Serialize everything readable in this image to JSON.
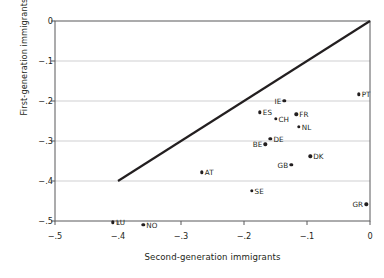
{
  "chart_data": {
    "type": "scatter",
    "title": "",
    "xlabel": "Second-generation immigrants",
    "ylabel": "First-generation immigrants",
    "xlim": [
      -0.5,
      0.0
    ],
    "ylim": [
      -0.5,
      0.0
    ],
    "xticks": [
      -0.5,
      -0.4,
      -0.3,
      -0.2,
      -0.1,
      0
    ],
    "yticks": [
      0,
      -0.1,
      -0.2,
      -0.3,
      -0.4,
      -0.5
    ],
    "xticklabels": [
      "−.5",
      "−.4",
      "−.3",
      "−.2",
      "−.1",
      "0"
    ],
    "yticklabels": [
      "0",
      "−.1",
      "−.2",
      "−.3",
      "−.4",
      "−.5"
    ],
    "grid": "horizontal",
    "legend": "none",
    "point_color": "#231f20",
    "line_color": "#231f20",
    "reference_line": {
      "name": "45-degree line",
      "x": [
        -0.4,
        0.0
      ],
      "y": [
        -0.4,
        0.0
      ]
    },
    "points": [
      {
        "label": "PT",
        "x": -0.018,
        "y": -0.183,
        "label_side": "right"
      },
      {
        "label": "IE",
        "x": -0.136,
        "y": -0.2,
        "label_side": "left"
      },
      {
        "label": "ES",
        "x": -0.175,
        "y": -0.228,
        "label_side": "right"
      },
      {
        "label": "FR",
        "x": -0.117,
        "y": -0.233,
        "label_side": "right"
      },
      {
        "label": "CH",
        "x": -0.15,
        "y": -0.245,
        "label_side": "right"
      },
      {
        "label": "NL",
        "x": -0.113,
        "y": -0.265,
        "label_side": "right"
      },
      {
        "label": "DE",
        "x": -0.158,
        "y": -0.295,
        "label_side": "right"
      },
      {
        "label": "BE",
        "x": -0.166,
        "y": -0.308,
        "label_side": "left"
      },
      {
        "label": "DK",
        "x": -0.095,
        "y": -0.338,
        "label_side": "right"
      },
      {
        "label": "GB",
        "x": -0.125,
        "y": -0.36,
        "label_side": "left"
      },
      {
        "label": "AT",
        "x": -0.267,
        "y": -0.378,
        "label_side": "right"
      },
      {
        "label": "SE",
        "x": -0.188,
        "y": -0.425,
        "label_side": "right"
      },
      {
        "label": "GR",
        "x": -0.006,
        "y": -0.458,
        "label_side": "left"
      },
      {
        "label": "LU",
        "x": -0.408,
        "y": -0.503,
        "label_side": "right"
      },
      {
        "label": "NO",
        "x": -0.36,
        "y": -0.51,
        "label_side": "right"
      }
    ]
  }
}
